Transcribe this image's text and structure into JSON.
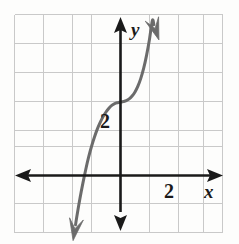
{
  "figure": {
    "background_color": "#fdfdfc",
    "width": 239,
    "height": 244
  },
  "chart_data": {
    "type": "line",
    "title": "",
    "subtitle": "",
    "xlabel": "x",
    "ylabel": "y",
    "grid": true,
    "legend": null,
    "legend_position": "none",
    "annotations": [],
    "axis_style": {
      "x_axis_color": "#1a1a1a",
      "y_axis_color": "#1a1a1a",
      "arrowheads": "both-ends",
      "grid_color": "#c9c9c9",
      "grid_spacing_units": 1
    },
    "xlim": [
      -3.65,
      3.5
    ],
    "ylim": [
      -2.0,
      5.55
    ],
    "xticks": [
      2
    ],
    "yticks": [
      2
    ],
    "xtick_labels": [
      "2"
    ],
    "ytick_labels": [
      "2"
    ],
    "series": [
      {
        "name": "cubic",
        "color": "#6b6b6b",
        "line_width": 3,
        "start_arrow": true,
        "end_arrow": true,
        "x": [
          -1.55,
          -1.5,
          -1.4,
          -1.3,
          -1.2,
          -1.1,
          -1.0,
          -0.9,
          -0.8,
          -0.7,
          -0.6,
          -0.5,
          -0.4,
          -0.3,
          -0.2,
          -0.1,
          0.0,
          0.1,
          0.2,
          0.3,
          0.4,
          0.5,
          0.6,
          0.7,
          0.8,
          0.9,
          1.0,
          1.1,
          1.15
        ],
        "y": [
          -1.7,
          -1.38,
          -0.8,
          -0.28,
          0.2,
          0.63,
          1.0,
          1.32,
          1.6,
          1.83,
          2.03,
          2.19,
          2.32,
          2.42,
          2.48,
          2.51,
          2.53,
          2.55,
          2.58,
          2.64,
          2.74,
          2.88,
          3.08,
          3.35,
          3.7,
          4.15,
          4.7,
          5.35,
          5.2
        ]
      }
    ]
  },
  "labels": {
    "y_axis_label": "y",
    "x_axis_label": "x",
    "y_tick_2": "2",
    "x_tick_2": "2"
  },
  "icons": {
    "x_axis_arrow_left": "arrow-left-icon",
    "x_axis_arrow_right": "arrow-right-icon",
    "y_axis_arrow_up": "arrow-up-icon",
    "y_axis_arrow_down": "arrow-down-icon",
    "curve_arrow_start": "curve-arrow-down-icon",
    "curve_arrow_end": "curve-arrow-up-icon"
  }
}
